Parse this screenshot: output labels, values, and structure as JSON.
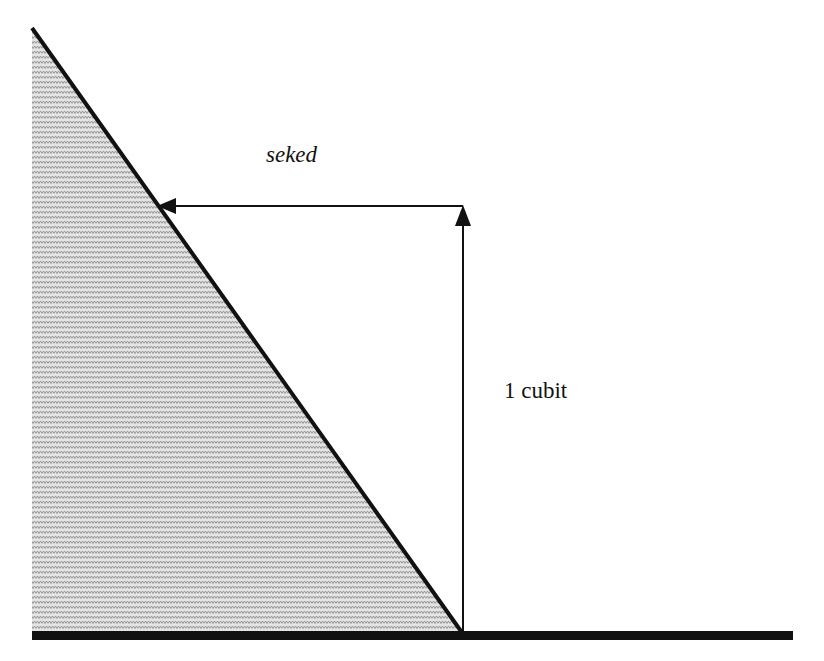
{
  "diagram": {
    "labels": {
      "run": "seked",
      "rise": "1 cubit"
    },
    "colors": {
      "line": "#111111",
      "shade": "#9a9a9a",
      "background": "#ffffff"
    }
  }
}
